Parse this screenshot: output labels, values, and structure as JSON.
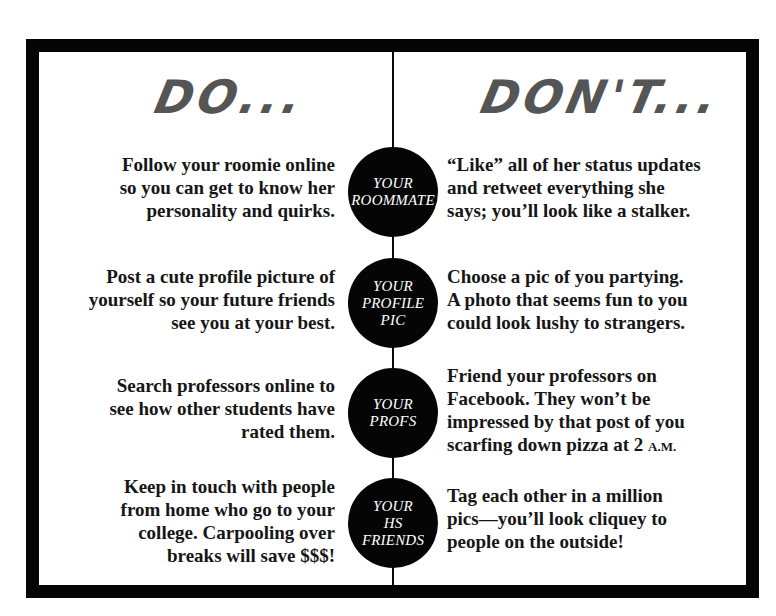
{
  "headings": {
    "do": "DO...",
    "dont": "DON'T..."
  },
  "rows": [
    {
      "topic": [
        "YOUR",
        "ROOMMATE"
      ],
      "do": [
        "Follow your roomie online",
        "so you can get to know her",
        "personality and quirks."
      ],
      "dont": [
        "“Like” all of her status updates",
        "and retweet everything she",
        "says; you’ll look like a stalker."
      ]
    },
    {
      "topic": [
        "YOUR",
        "PROFILE",
        "PIC"
      ],
      "do": [
        "Post a cute profile picture of",
        "yourself so your future friends",
        "see you at your best."
      ],
      "dont": [
        "Choose a pic of you partying.",
        "A photo that seems fun to you",
        "could look lushy to strangers."
      ]
    },
    {
      "topic": [
        "YOUR",
        "PROFS"
      ],
      "do": [
        "Search professors online to",
        "see how other students have",
        "rated them."
      ],
      "dont": [
        "Friend your professors on",
        "Facebook. They won’t be",
        "impressed by that post of you",
        "scarfing down pizza at 2 ",
        "A.M."
      ]
    },
    {
      "topic": [
        "YOUR",
        "HS",
        "FRIENDS"
      ],
      "do": [
        "Keep in touch with people",
        "from home who go to your",
        "college. Carpooling over",
        "breaks will save $$$!"
      ],
      "dont": [
        "Tag each other in a million",
        "pics—you’ll look cliquey to",
        "people on the outside!"
      ]
    }
  ],
  "colors": {
    "frame": "#050505",
    "heading": "#555555",
    "circle": "#050505",
    "text": "#161616"
  }
}
